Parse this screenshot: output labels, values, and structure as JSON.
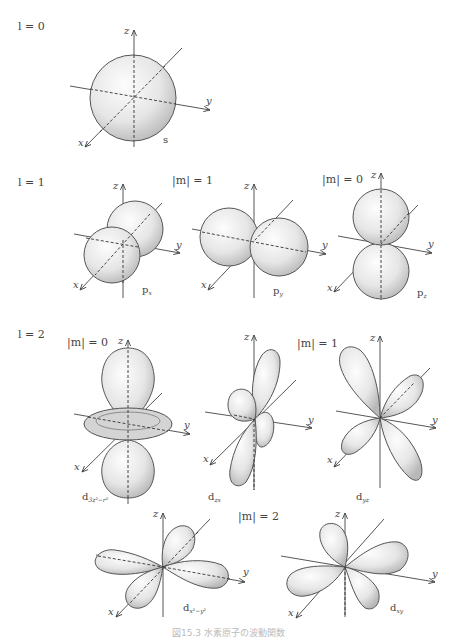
{
  "rows": [
    {
      "label": "l = 0"
    },
    {
      "label": "l = 1"
    },
    {
      "label": "l = 2"
    }
  ],
  "m_labels": {
    "p_m1": "|m| = 1",
    "p_m0": "|m| = 0",
    "d_m0": "|m| = 0",
    "d_m1": "|m| = 1",
    "d_m2": "|m| = 2"
  },
  "axes": {
    "x": "x",
    "y": "y",
    "z": "z"
  },
  "orbitals": [
    {
      "id": "s",
      "main": "s",
      "sub": ""
    },
    {
      "id": "px",
      "main": "p",
      "sub": "x"
    },
    {
      "id": "py",
      "main": "p",
      "sub": "y"
    },
    {
      "id": "pz",
      "main": "p",
      "sub": "z"
    },
    {
      "id": "dz2",
      "main": "d",
      "sub": "3z²−r²"
    },
    {
      "id": "dzx",
      "main": "d",
      "sub": "zx"
    },
    {
      "id": "dyz",
      "main": "d",
      "sub": "yz"
    },
    {
      "id": "dx2y2",
      "main": "d",
      "sub": "x²−y²"
    },
    {
      "id": "dxy",
      "main": "d",
      "sub": "xy"
    }
  ],
  "colors": {
    "lobe_light": "#f7f7f7",
    "lobe_dark": "#bdbdbd",
    "axis": "#444444"
  },
  "caption": "図15.3 水素原子の波動関数"
}
